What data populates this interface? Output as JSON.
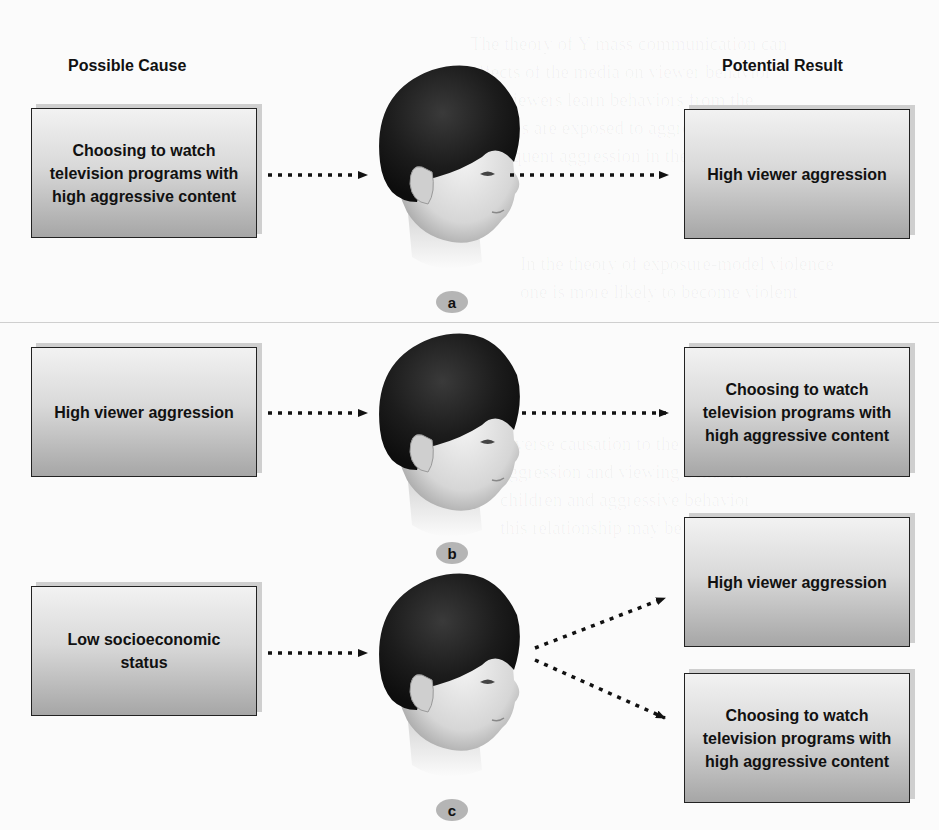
{
  "headings": {
    "cause": "Possible Cause",
    "result": "Potential Result"
  },
  "panels": [
    {
      "label": "a",
      "causes": [
        "Choosing to watch television programs with high aggressive content"
      ],
      "results": [
        "High viewer aggression"
      ]
    },
    {
      "label": "b",
      "causes": [
        "High viewer aggression"
      ],
      "results": [
        "Choosing to watch television programs with high aggressive content"
      ]
    },
    {
      "label": "c",
      "causes": [
        "Low socioeconomic status"
      ],
      "results": [
        "High viewer aggression",
        "Choosing to watch television programs with high aggressive content"
      ]
    }
  ],
  "colors": {
    "box_top": "#f2f2f2",
    "box_bottom": "#a6a6a6",
    "badge": "#b5b5b5",
    "arrow": "#111111"
  }
}
